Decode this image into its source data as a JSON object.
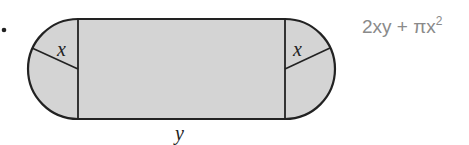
{
  "figure": {
    "shape": "rectangle with semicircle on each end",
    "radius_label": "x",
    "length_label": "y",
    "fill_color": "#d4d4d4",
    "stroke_color": "#222222"
  },
  "answer": {
    "prefix": "2xy + πx",
    "exponent": "2"
  }
}
